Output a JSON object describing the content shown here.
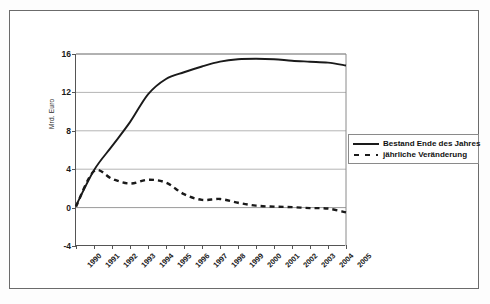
{
  "chart_data": {
    "type": "line",
    "title": "",
    "xlabel": "",
    "ylabel": "Mrd. Euro",
    "x": [
      "1990",
      "1991",
      "1992",
      "1993",
      "1994",
      "1995",
      "1996",
      "1997",
      "1998",
      "1999",
      "2000",
      "2001",
      "2002",
      "2003",
      "2004",
      "2005"
    ],
    "ylim": [
      -4,
      16
    ],
    "yticks": [
      16,
      12,
      8,
      4,
      0,
      -4
    ],
    "ytick_labels": [
      "16",
      "12",
      "8",
      "4",
      "0",
      "-4"
    ],
    "grid": "horizontal",
    "legend_position": "right",
    "series": [
      {
        "name": "Bestand Ende des Jahres",
        "style": "solid",
        "color": "#1a1a1a",
        "values": [
          0.2,
          3.9,
          6.4,
          8.9,
          11.8,
          13.4,
          14.1,
          14.7,
          15.2,
          15.45,
          15.5,
          15.45,
          15.3,
          15.2,
          15.1,
          14.8
        ]
      },
      {
        "name": "jährliche Veränderung",
        "style": "dashed",
        "color": "#1a1a1a",
        "values": [
          0.1,
          3.8,
          3.0,
          2.5,
          2.9,
          2.6,
          1.4,
          0.8,
          0.9,
          0.5,
          0.2,
          0.1,
          0.05,
          -0.05,
          -0.1,
          -0.5
        ]
      }
    ]
  },
  "legend": {
    "items": [
      {
        "label": "Bestand Ende des Jahres",
        "style": "solid"
      },
      {
        "label": "jährliche Veränderung",
        "style": "dashed"
      }
    ]
  }
}
